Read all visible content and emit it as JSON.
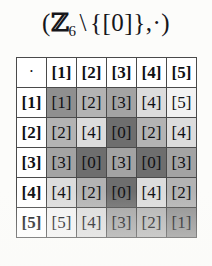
{
  "title": {
    "full_text": "(ℤ₆ \\ {[0]},·)",
    "open_paren": "(",
    "set_symbol": "ℤ",
    "subscript": "6",
    "setminus": "\\",
    "excluded_set": "{[0]}",
    "comma": ",",
    "operation_symbol": "·",
    "close_paren": ")"
  },
  "table": {
    "corner_label": "·",
    "column_headers": [
      "[1]",
      "[2]",
      "[3]",
      "[4]",
      "[5]"
    ],
    "row_headers": [
      "[1]",
      "[2]",
      "[3]",
      "[4]",
      "[5]"
    ],
    "rows": [
      {
        "header": "[1]",
        "cells": [
          "[1]",
          "[2]",
          "[3]",
          "[4]",
          "[5]"
        ]
      },
      {
        "header": "[2]",
        "cells": [
          "[2]",
          "[4]",
          "[0]",
          "[2]",
          "[4]"
        ]
      },
      {
        "header": "[3]",
        "cells": [
          "[3]",
          "[0]",
          "[3]",
          "[0]",
          "[3]"
        ]
      },
      {
        "header": "[4]",
        "cells": [
          "[4]",
          "[2]",
          "[0]",
          "[4]",
          "[2]"
        ]
      },
      {
        "header": "[5]",
        "cells": [
          "[5]",
          "[4]",
          "[3]",
          "[2]",
          "[1]"
        ]
      }
    ]
  },
  "chart_data": {
    "type": "table",
    "categories": [
      "[1]",
      "[2]",
      "[3]",
      "[4]",
      "[5]"
    ],
    "series": [
      {
        "name": "[1]",
        "values": [
          "[1]",
          "[2]",
          "[3]",
          "[4]",
          "[5]"
        ]
      },
      {
        "name": "[2]",
        "values": [
          "[2]",
          "[4]",
          "[0]",
          "[2]",
          "[4]"
        ]
      },
      {
        "name": "[3]",
        "values": [
          "[3]",
          "[0]",
          "[3]",
          "[0]",
          "[3]"
        ]
      },
      {
        "name": "[4]",
        "values": [
          "[4]",
          "[2]",
          "[0]",
          "[4]",
          "[2]"
        ]
      },
      {
        "name": "[5]",
        "values": [
          "[5]",
          "[4]",
          "[3]",
          "[2]",
          "[1]"
        ]
      }
    ],
    "xlabel": "",
    "ylabel": "",
    "grid": true,
    "legend": "none"
  },
  "shading": {
    "note": "cell background greyscale keyed to the residue value",
    "value_colors": {
      "[0]": "#6e6e6e",
      "[1]": "#8f8f8f",
      "[2]": "#b3b3b3",
      "[3]": "#a3a3a3",
      "[4]": "#dcdcdc",
      "[5]": "#f2f2f2"
    },
    "header_color": "#ffffff",
    "border_color": "#4a4a4a",
    "page_color": "#fcfcfa",
    "text_color": "#101014"
  }
}
